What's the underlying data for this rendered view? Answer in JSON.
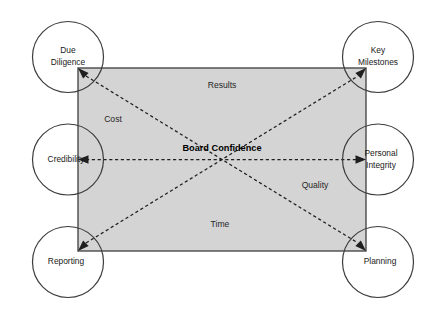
{
  "diagram": {
    "title": "Board Confidence",
    "colors": {
      "canvas_background": "#ffffff",
      "rectangle_fill": "#d4d4d4",
      "rectangle_stroke": "#4a4a4a",
      "circle_fill": "#ffffff",
      "circle_stroke": "#3c3c3c",
      "arrow_color": "#1f1f1f",
      "text_color": "#1a1a1a"
    },
    "center": {
      "label": "Board Confidence"
    },
    "nodes": [
      {
        "id": "due-diligence",
        "lines": [
          "Due",
          "Diligence"
        ],
        "position": "top-left"
      },
      {
        "id": "key-milestones",
        "lines": [
          "Key",
          "Milestones"
        ],
        "position": "top-right"
      },
      {
        "id": "credibility",
        "lines": [
          "Credibility"
        ],
        "position": "middle-left"
      },
      {
        "id": "personal-integrity",
        "lines": [
          "Personal",
          "Integrity"
        ],
        "position": "middle-right"
      },
      {
        "id": "reporting",
        "lines": [
          "Reporting"
        ],
        "position": "bottom-left"
      },
      {
        "id": "planning",
        "lines": [
          "Planning"
        ],
        "position": "bottom-right"
      }
    ],
    "zone_labels": [
      {
        "id": "results",
        "label": "Results",
        "position": "top-center"
      },
      {
        "id": "cost",
        "label": "Cost",
        "position": "upper-left"
      },
      {
        "id": "quality",
        "label": "Quality",
        "position": "lower-right"
      },
      {
        "id": "time",
        "label": "Time",
        "position": "bottom-center"
      }
    ],
    "connectors": [
      {
        "id": "diagonal-due-diligence-to-planning",
        "from": "due-diligence",
        "to": "planning",
        "style": "dashed",
        "arrows": "both"
      },
      {
        "id": "diagonal-reporting-to-key-milestones",
        "from": "reporting",
        "to": "key-milestones",
        "style": "dashed",
        "arrows": "both"
      },
      {
        "id": "horizontal-credibility-to-integrity",
        "from": "credibility",
        "to": "personal-integrity",
        "style": "dashed",
        "arrows": "both"
      }
    ]
  }
}
